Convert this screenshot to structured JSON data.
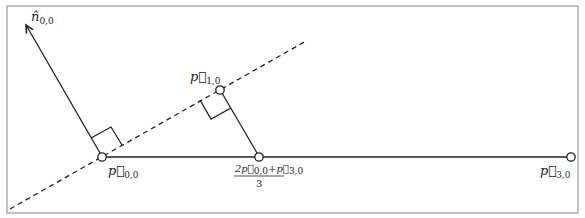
{
  "figure": {
    "colors": {
      "stroke": "#222222",
      "frame": "#9a9a9a",
      "background": "#ffffff"
    },
    "labels": {
      "normal": {
        "base": "n̂",
        "sub": "0,0"
      },
      "p00": {
        "base": "p⃗",
        "sub": "0,0"
      },
      "p10": {
        "base": "p⃗",
        "sub": "1,0"
      },
      "p30": {
        "base": "p⃗",
        "sub": "3,0"
      },
      "midpoint": {
        "numerator": "2p⃗",
        "num_sub1": "0,0",
        "plus": "+p⃗",
        "num_sub2": "3,0",
        "denominator": "3"
      }
    },
    "points": {
      "p00": [
        102,
        157
      ],
      "p10": [
        220,
        90
      ],
      "p30": [
        571,
        157
      ],
      "midpoint": [
        259,
        157
      ],
      "normal_tip": [
        25,
        23
      ]
    }
  }
}
